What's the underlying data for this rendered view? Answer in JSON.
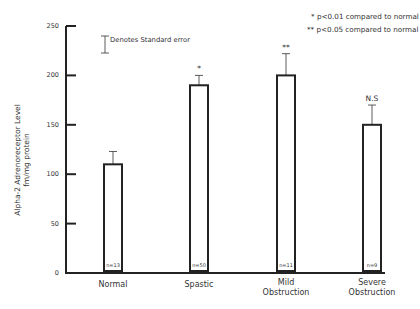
{
  "chart_data": {
    "type": "bar",
    "title": "",
    "xlabel": "",
    "ylabel": "Alpha-2 Adrenoreceptor Level fm/mg protein",
    "ylabel_lines": [
      "Alpha-2 Adrenoreceptor Level",
      "fm/mg protein"
    ],
    "ylim": [
      0,
      250
    ],
    "yticks": [
      0,
      50,
      100,
      150,
      200,
      250
    ],
    "grid": false,
    "categories": [
      "Normal",
      "Spastic",
      "Mild Obstruction",
      "Severe Obstruction"
    ],
    "category_lines": [
      [
        "Normal"
      ],
      [
        "Spastic"
      ],
      [
        "Mild",
        "Obstruction"
      ],
      [
        "Severe",
        "Obstruction"
      ]
    ],
    "values": [
      110,
      190,
      200,
      150
    ],
    "error_upper": [
      123,
      200,
      222,
      170
    ],
    "standard_error": [
      13,
      10,
      22,
      20
    ],
    "n": [
      "n=13",
      "n=50",
      "n=11",
      "n=9"
    ],
    "significance": [
      "",
      "*",
      "**",
      "N.S"
    ],
    "legend": {
      "error_bar_text": "Denotes Standard error",
      "notes": [
        "* p<0.01 compared to normal",
        "** p<0.05 compared to normal"
      ],
      "position": "top-right"
    }
  }
}
